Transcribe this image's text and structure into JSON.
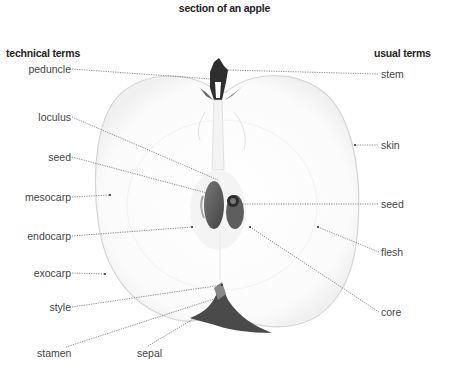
{
  "title": "section of an apple",
  "headings": {
    "technical": "technical terms",
    "usual": "usual terms"
  },
  "technical_terms": [
    {
      "id": "peduncle",
      "label": "peduncle"
    },
    {
      "id": "loculus",
      "label": "loculus"
    },
    {
      "id": "seed",
      "label": "seed"
    },
    {
      "id": "mesocarp",
      "label": "mesocarp"
    },
    {
      "id": "endocarp",
      "label": "endocarp"
    },
    {
      "id": "exocarp",
      "label": "exocarp"
    },
    {
      "id": "style",
      "label": "style"
    },
    {
      "id": "stamen",
      "label": "stamen"
    },
    {
      "id": "sepal",
      "label": "sepal"
    }
  ],
  "usual_terms": [
    {
      "id": "stem",
      "label": "stem"
    },
    {
      "id": "skin",
      "label": "skin"
    },
    {
      "id": "seed",
      "label": "seed"
    },
    {
      "id": "flesh",
      "label": "flesh"
    },
    {
      "id": "core",
      "label": "core"
    }
  ],
  "colors": {
    "outline": "#cfcfcf",
    "dark": "#3a3a3a",
    "leader": "#555555"
  }
}
